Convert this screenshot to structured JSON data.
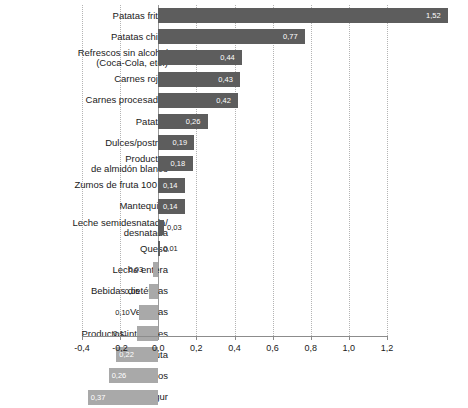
{
  "chart_data": {
    "type": "bar",
    "orientation": "horizontal",
    "title": "",
    "subtitle": "",
    "xlabel": "",
    "ylabel": "",
    "xlim": [
      -0.4,
      1.3
    ],
    "grid": true,
    "legend": null,
    "decimal_separator": ",",
    "colors": {
      "positive": "#5d5d5d",
      "negative": "#a9a9a9",
      "gridline": "#b4b4b4",
      "zero_line": "#9a9a9a",
      "axis": "#8c8c8c",
      "text": "#1a1a1a",
      "value_inside": "#ffffff"
    },
    "xticks": [
      -0.4,
      -0.2,
      0.0,
      0.2,
      0.4,
      0.6,
      0.8,
      1.0,
      1.2
    ],
    "xticklabels": [
      "-0,4",
      "-0,2",
      "0,0",
      "0,2",
      "0,4",
      "0,6",
      "0,8",
      "1,0",
      "1,2"
    ],
    "categories": [
      "Patatas fritas",
      "Patatas chips",
      "Refrescos sin alcohol\n(Coca-Cola, etc.)",
      "Carnes rojas",
      "Carnes procesadas",
      "Patatas",
      "Dulces/postres",
      "Productos\nde almidón blanco",
      "Zumos de fruta 100 %",
      "Mantequilla",
      "Leche semidesnatada/\ndesnatada",
      "Queso",
      "Leche entera",
      "Bebidas dietéticas",
      "Verduras",
      "Productos integrales",
      "Fruta",
      "Frutos secos",
      "Yogur"
    ],
    "values": [
      1.52,
      0.77,
      0.44,
      0.43,
      0.42,
      0.26,
      0.19,
      0.18,
      0.14,
      0.14,
      0.03,
      0.01,
      -0.03,
      -0.05,
      -0.1,
      -0.11,
      -0.22,
      -0.26,
      -0.37
    ],
    "value_labels": [
      "1,52",
      "0,77",
      "0,44",
      "0,43",
      "0,42",
      "0,26",
      "0,19",
      "0,18",
      "0,14",
      "0,14",
      "0,03",
      "0,01",
      "0,03",
      "0,05",
      "0,10",
      "0,11",
      "0,22",
      "0,26",
      "0,37"
    ]
  }
}
